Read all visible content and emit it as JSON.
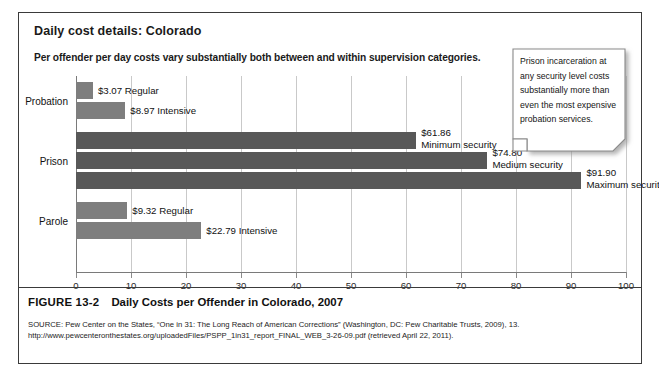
{
  "figure": {
    "title": "Daily cost details: Colorado",
    "subtitle": "Per offender per day costs vary substantially both between and within supervision categories.",
    "figure_number": "FIGURE 13-2",
    "figure_title": "Daily Costs per Offender in Colorado, 2007",
    "source_line1": "SOURCE: Pew Center on the States, “One in 31: The Long Reach of American Corrections” (Washington, DC: Pew Charitable Trusts, 2009), 13.",
    "source_line2": "http://www.pewcenteronthestates.org/uploadedFiles/PSPP_1in31_report_FINAL_WEB_3-26-09.pdf (retrieved April 22, 2011)."
  },
  "callout": {
    "text": "Prison incarceration at any security level costs substantially more than even the most expensive probation services."
  },
  "colors": {
    "bar_light": "#7e7e7e",
    "bar_dark": "#585858",
    "grid": "#c9c9c9",
    "axis": "#7a7a7a",
    "frame": "#3a3a3a",
    "text": "#111111"
  },
  "chart_data": {
    "type": "bar",
    "orientation": "horizontal",
    "title": "Daily Costs per Offender in Colorado, 2007",
    "xlabel": "",
    "ylabel": "",
    "xlim": [
      0,
      100
    ],
    "xticks": [
      0,
      10,
      20,
      30,
      40,
      50,
      60,
      70,
      80,
      90,
      100
    ],
    "grid": true,
    "legend": "none",
    "groups": [
      {
        "category": "Probation",
        "bars": [
          {
            "label": "Regular",
            "value": 3.07,
            "value_text": "$3.07",
            "shade": "light"
          },
          {
            "label": "Intensive",
            "value": 8.97,
            "value_text": "$8.97",
            "shade": "light"
          }
        ]
      },
      {
        "category": "Prison",
        "bars": [
          {
            "label": "Minimum security",
            "value": 61.86,
            "value_text": "$61.86",
            "shade": "dark"
          },
          {
            "label": "Medium security",
            "value": 74.8,
            "value_text": "$74.80",
            "shade": "dark"
          },
          {
            "label": "Maximum security",
            "value": 91.9,
            "value_text": "$91.90",
            "shade": "dark"
          }
        ]
      },
      {
        "category": "Parole",
        "bars": [
          {
            "label": "Regular",
            "value": 9.32,
            "value_text": "$9.32",
            "shade": "light"
          },
          {
            "label": "Intensive",
            "value": 22.79,
            "value_text": "$22.79",
            "shade": "light"
          }
        ]
      }
    ]
  }
}
